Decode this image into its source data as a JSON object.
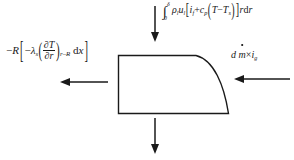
{
  "diagram": {
    "background_color": "#ffffff",
    "line_color": "#1a1a1a",
    "labels": {
      "flux_in_top": {
        "name": "liquid-film-enthalpy-influx",
        "integral_lower_limit": "0",
        "integral_upper_limit": "δ",
        "density": "ρ",
        "density_sub": "l",
        "velocity": "u",
        "velocity_sub": "l",
        "bracket_open": "[",
        "enthalpy": "i",
        "enthalpy_sub": "f",
        "plus": "+",
        "specific_heat": "c",
        "specific_heat_sub": "p",
        "paren_open": "(",
        "temperature": "T",
        "minus": "−",
        "temperature_ref": "T",
        "temperature_ref_sub": "s",
        "paren_close": ")",
        "bracket_close": "]",
        "radius": "r",
        "differential": "d",
        "differential_var": "r"
      },
      "conduction_left": {
        "name": "wall-conduction-heat-flux",
        "minus_sign": "−",
        "radius_symbol": "R",
        "bracket_open": "[",
        "inner_minus": "−",
        "conductivity": "λ",
        "conductivity_sub": "s",
        "paren_open": "(",
        "partial": "∂",
        "numerator_var": "T",
        "denominator_var": "r",
        "paren_close": ")",
        "evaluated_at": "r–R",
        "differential": "d",
        "differential_var": "x",
        "bracket_close": "]"
      },
      "mass_flux_right": {
        "name": "vapour-mass-enthalpy-influx",
        "differential": "d",
        "mass_flow": "m",
        "times": "×",
        "enthalpy": "i",
        "enthalpy_sub": "g"
      }
    },
    "arrows": [
      {
        "name": "arrow-top",
        "direction": "down",
        "label_ref": "flux_in_top"
      },
      {
        "name": "arrow-left",
        "direction": "left",
        "label_ref": "conduction_left"
      },
      {
        "name": "arrow-right",
        "direction": "left",
        "label_ref": "mass_flux_right"
      },
      {
        "name": "arrow-bottom",
        "direction": "down",
        "label_ref": null
      }
    ],
    "shape": {
      "name": "control-volume",
      "description": "rectangle with concave curved right edge"
    }
  }
}
